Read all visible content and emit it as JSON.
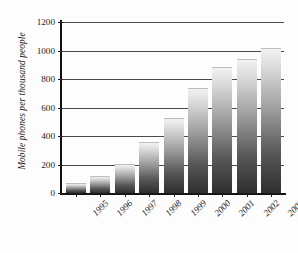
{
  "chart_data": {
    "type": "bar",
    "title": "",
    "subtitle": "",
    "xlabel": "",
    "ylabel": "Mobile phones per thousand people",
    "categories": [
      "1995",
      "1996",
      "1997",
      "1998",
      "1999",
      "2000",
      "2001",
      "2002",
      "2003"
    ],
    "values": [
      60,
      110,
      200,
      350,
      520,
      730,
      880,
      935,
      1010
    ],
    "series": [
      {
        "name": "Mobile phones per thousand people",
        "values": [
          60,
          110,
          200,
          350,
          520,
          730,
          880,
          935,
          1010
        ]
      }
    ],
    "ylim": [
      0,
      1200
    ],
    "yticks": [
      0,
      200,
      400,
      600,
      800,
      1000,
      1200
    ],
    "ytick_labels": [
      "0",
      "200",
      "400",
      "600",
      "800",
      "1000",
      "1200"
    ],
    "grid": "horizontal",
    "legend": "none",
    "bar_style": "vertical-gradient-grayscale",
    "xtick_rotation": -45
  },
  "colors": {
    "background": "#ffffff",
    "axis": "#111111",
    "gridline": "#4a4a4a",
    "bar_top": "#f2f2f2",
    "bar_bottom": "#2e2e2e",
    "text": "#1d1d1d"
  }
}
